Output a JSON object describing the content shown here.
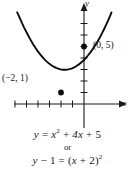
{
  "figure": {
    "type": "coordinate-plane-parabola",
    "axes": {
      "x_label": "x",
      "y_label": "y",
      "x_axis_y_pixel": 104,
      "y_axis_x_pixel": 84,
      "unit_px": 11.5,
      "x_ticks": [
        -6,
        -5,
        -4,
        -3,
        -2,
        -1
      ],
      "y_ticks": [
        1,
        2,
        3,
        4,
        5,
        6,
        7
      ]
    },
    "points": [
      {
        "name": "vertex",
        "label": "(−2, 1)",
        "x": -2,
        "y": 1
      },
      {
        "name": "y-intercept",
        "label": "(0, 5)",
        "x": 0,
        "y": 5
      }
    ],
    "curve": {
      "name": "parabola",
      "equation": "y = x^2 + 4x + 5",
      "vertex": [
        -2,
        1
      ],
      "opens": "up",
      "x_domain": [
        -5.8,
        0.8
      ]
    },
    "colors": {
      "ink": "#1a1a1a",
      "background": "#ffffff",
      "curve": "#000000"
    }
  },
  "captions": {
    "equation_standard": {
      "lhs": "y",
      "eq": "=",
      "term1": "x",
      "term1_exp": "2",
      "plus1": "+",
      "term2": "4x",
      "plus2": "+",
      "term3": "5"
    },
    "connector": "or",
    "equation_vertex": {
      "lhs_var": "y",
      "minus": "−",
      "lhs_const": "1",
      "eq": "=",
      "open": "(",
      "inner_var": "x",
      "plus": "+",
      "inner_const": "2",
      "close": ")",
      "exp": "2"
    }
  }
}
